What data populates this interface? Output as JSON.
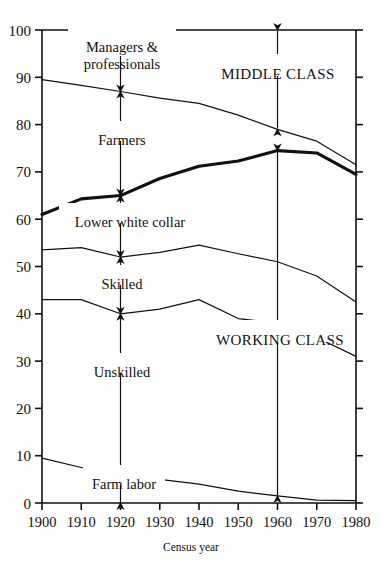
{
  "chart_data": {
    "type": "area",
    "title": "",
    "subtitle": "",
    "xlabel": "Census year",
    "ylabel": "",
    "xlim": [
      1900,
      1980
    ],
    "ylim": [
      0,
      100
    ],
    "grid": false,
    "legend_position": "inline-annotations",
    "x": [
      1900,
      1910,
      1920,
      1930,
      1940,
      1950,
      1960,
      1970,
      1980
    ],
    "xtick_labels": [
      "1900",
      "1910",
      "1920",
      "1930",
      "1940",
      "1950",
      "1960",
      "1970",
      "1980"
    ],
    "ytick_labels": [
      "0",
      "10",
      "20",
      "30",
      "40",
      "50",
      "60",
      "70",
      "80",
      "90",
      "100"
    ],
    "ytick_values": [
      0,
      10,
      20,
      30,
      40,
      50,
      60,
      70,
      80,
      90,
      100
    ],
    "series": [
      {
        "name": "Managers & professionals boundary",
        "style": "thin",
        "values": [
          89.5,
          88.3,
          87.0,
          85.6,
          84.5,
          82.0,
          79.0,
          76.5,
          71.5
        ]
      },
      {
        "name": "Lower white collar boundary",
        "style": "bold",
        "values": [
          61.0,
          64.3,
          65.0,
          68.6,
          71.2,
          72.3,
          74.5,
          74.0,
          69.5
        ]
      },
      {
        "name": "Skilled boundary",
        "style": "thin",
        "values": [
          53.5,
          54.0,
          52.0,
          53.0,
          54.5,
          52.7,
          51.0,
          48.0,
          42.5
        ]
      },
      {
        "name": "Unskilled boundary",
        "style": "thin",
        "values": [
          43.0,
          43.0,
          40.0,
          41.0,
          43.0,
          39.0,
          38.0,
          35.0,
          31.0
        ]
      },
      {
        "name": "Farm labor boundary",
        "style": "thin",
        "values": [
          9.5,
          7.5,
          5.5,
          5.0,
          4.0,
          2.5,
          1.5,
          0.6,
          0.5
        ]
      }
    ],
    "annotations": [
      {
        "name": "Managers & professionals",
        "line1": "Managers &",
        "line2": "professionals",
        "at_year": 1920,
        "from": 100,
        "to": 87
      },
      {
        "name": "Farmers",
        "line1": "Farmers",
        "line2": "",
        "at_year": 1920,
        "from": 87,
        "to": 65
      },
      {
        "name": "Lower white collar",
        "line1": "Lower white collar",
        "line2": "",
        "at_year": 1920,
        "from": 65,
        "to": 52
      },
      {
        "name": "Skilled",
        "line1": "Skilled",
        "line2": "",
        "at_year": 1920,
        "from": 52,
        "to": 40
      },
      {
        "name": "Unskilled",
        "line1": "Unskilled",
        "line2": "",
        "at_year": 1920,
        "from": 40,
        "to": 5.5
      },
      {
        "name": "Farm labor",
        "line1": "Farm labor",
        "line2": "",
        "at_year": 1920,
        "from": 5.5,
        "to": 0
      },
      {
        "name": "MIDDLE CLASS",
        "line1": "MIDDLE CLASS",
        "line2": "",
        "at_year": 1960,
        "from": 100,
        "to": 79
      },
      {
        "name": "WORKING CLASS",
        "line1": "WORKING CLASS",
        "line2": "",
        "at_year": 1960,
        "from": 74.5,
        "to": 1.5
      }
    ]
  },
  "labels": {
    "managers": "Managers &",
    "professionals": "professionals",
    "farmers": "Farmers",
    "lower_white_collar": "Lower white collar",
    "skilled": "Skilled",
    "unskilled": "Unskilled",
    "farm_labor": "Farm labor",
    "middle_class": "MIDDLE CLASS",
    "working_class": "WORKING CLASS",
    "census_year": "Census year"
  },
  "ticks": {
    "y": [
      "100",
      "90",
      "80",
      "70",
      "60",
      "50",
      "40",
      "30",
      "20",
      "10",
      "0"
    ],
    "x": [
      "1900",
      "1910",
      "1920",
      "1930",
      "1940",
      "1950",
      "1960",
      "1970",
      "1980"
    ]
  },
  "colors": {
    "ink": "#111111",
    "background": "#ffffff"
  }
}
